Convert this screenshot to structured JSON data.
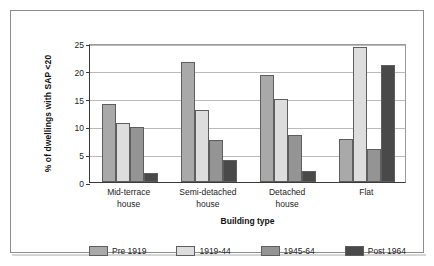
{
  "chart_data": {
    "type": "bar",
    "title": "",
    "xlabel": "Building type",
    "ylabel": "% of dwellings with SAP <20",
    "ylim": [
      0,
      25
    ],
    "yticks": [
      0,
      5,
      10,
      15,
      20,
      25
    ],
    "ytick_labels": [
      "0",
      "5",
      "10",
      "15",
      "20",
      "25"
    ],
    "grid": "horizontal",
    "legend_position": "bottom",
    "categories": [
      "Mid-terrace house",
      "Semi-detached house",
      "Detached house",
      "Flat"
    ],
    "category_lines": [
      [
        "Mid-terrace",
        "house"
      ],
      [
        "Semi-detached",
        "house"
      ],
      [
        "Detached",
        "house"
      ],
      [
        "Flat",
        ""
      ]
    ],
    "series": [
      {
        "name": "Pre 1919",
        "color": "#a9a9a9",
        "values": [
          14.1,
          21.5,
          19.2,
          7.7
        ]
      },
      {
        "name": "1919-44",
        "color": "#dddddd",
        "values": [
          10.6,
          13.0,
          15.0,
          24.3
        ]
      },
      {
        "name": "1945-64",
        "color": "#949494",
        "values": [
          9.9,
          7.6,
          8.4,
          5.9
        ]
      },
      {
        "name": "Post 1964",
        "color": "#494949",
        "values": [
          1.6,
          3.9,
          1.9,
          21.0
        ]
      }
    ]
  },
  "figure": {
    "border_color": "#8d8d8d",
    "axis_color": "#3a3a3a",
    "gridline_color": "#b9b9b9"
  }
}
